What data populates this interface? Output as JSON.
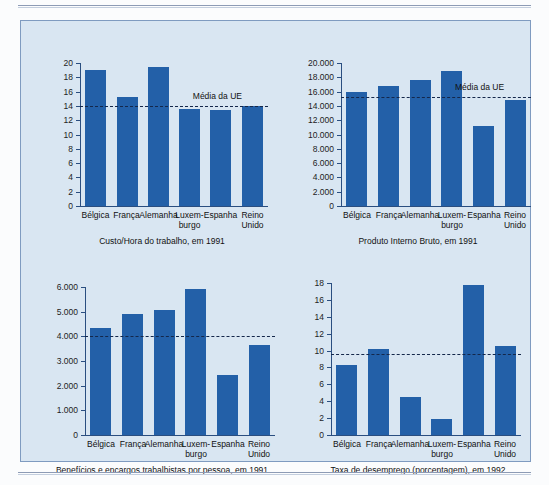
{
  "figure": {
    "background_color": "#d9e6f2",
    "bar_color": "#2360a8",
    "axis_color": "#2a4e80",
    "average_line_label": "Média da UE",
    "countries": [
      "Bélgica",
      "França",
      "Alemanha",
      "Luxem-\nburgo",
      "Espanha",
      "Reino\nUnido"
    ]
  },
  "chart_data": [
    {
      "id": "custo-hora",
      "type": "bar",
      "title": "Custo/Hora do trabalho, em 1991",
      "xlabel": "",
      "ylabel": "",
      "categories": [
        "Bélgica",
        "França",
        "Alemanha",
        "Luxem-burgo",
        "Espanha",
        "Reino Unido"
      ],
      "values": [
        19.0,
        15.3,
        19.5,
        13.6,
        13.4,
        14.0
      ],
      "ylim": [
        0,
        20
      ],
      "yticks": [
        "0",
        "2",
        "4",
        "6",
        "8",
        "10",
        "12",
        "14",
        "16",
        "18",
        "20"
      ],
      "ytick_values": [
        0,
        2,
        4,
        6,
        8,
        10,
        12,
        14,
        16,
        18,
        20
      ],
      "annotations": [
        {
          "label": "Média da UE",
          "value": 14.0,
          "style": "dashed-horizontal"
        }
      ],
      "grid": false,
      "legend": "none"
    },
    {
      "id": "pib",
      "type": "bar",
      "title": "Produto Interno Bruto, em 1991",
      "xlabel": "",
      "ylabel": "",
      "categories": [
        "Bélgica",
        "França",
        "Alemanha",
        "Luxem-burgo",
        "Espanha",
        "Reino Unido"
      ],
      "values": [
        16000,
        16800,
        17600,
        18900,
        11200,
        14800
      ],
      "ylim": [
        0,
        20000
      ],
      "yticks": [
        "0",
        "2.000",
        "4.000",
        "6.000",
        "8.000",
        "10.000",
        "12.000",
        "14.000",
        "16.000",
        "18.000",
        "20.000"
      ],
      "ytick_values": [
        0,
        2000,
        4000,
        6000,
        8000,
        10000,
        12000,
        14000,
        16000,
        18000,
        20000
      ],
      "annotations": [
        {
          "label": "Média da UE",
          "value": 15300,
          "style": "dashed-horizontal"
        }
      ],
      "grid": false,
      "legend": "none"
    },
    {
      "id": "beneficios",
      "type": "bar",
      "title": "Benefícios e encargos trabalhistas por pessoa, em 1991",
      "xlabel": "",
      "ylabel": "",
      "categories": [
        "Bélgica",
        "França",
        "Alemanha",
        "Luxem-burgo",
        "Espanha",
        "Reino Unido"
      ],
      "values": [
        4350,
        4900,
        5080,
        5900,
        2450,
        3650
      ],
      "ylim": [
        0,
        6000
      ],
      "yticks": [
        "0",
        "1.000",
        "2.000",
        "3.000",
        "4.000",
        "5.000",
        "6.000"
      ],
      "ytick_values": [
        0,
        1000,
        2000,
        3000,
        4000,
        5000,
        6000
      ],
      "annotations": [
        {
          "label": "",
          "value": 4000,
          "style": "dashed-horizontal"
        }
      ],
      "grid": false,
      "legend": "none"
    },
    {
      "id": "desemprego",
      "type": "bar",
      "title": "Taxa de desemprego (porcentagem), em 1992",
      "xlabel": "",
      "ylabel": "",
      "categories": [
        "Bélgica",
        "França",
        "Alemanha",
        "Luxem-burgo",
        "Espanha",
        "Reino Unido"
      ],
      "values": [
        8.3,
        10.2,
        4.5,
        1.9,
        17.8,
        10.5
      ],
      "ylim": [
        0,
        18
      ],
      "yticks": [
        "0",
        "2",
        "4",
        "6",
        "8",
        "10",
        "12",
        "14",
        "16",
        "18"
      ],
      "ytick_values": [
        0,
        2,
        4,
        6,
        8,
        10,
        12,
        14,
        16,
        18
      ],
      "annotations": [
        {
          "label": "",
          "value": 9.6,
          "style": "dashed-horizontal"
        }
      ],
      "grid": false,
      "legend": "none"
    }
  ]
}
